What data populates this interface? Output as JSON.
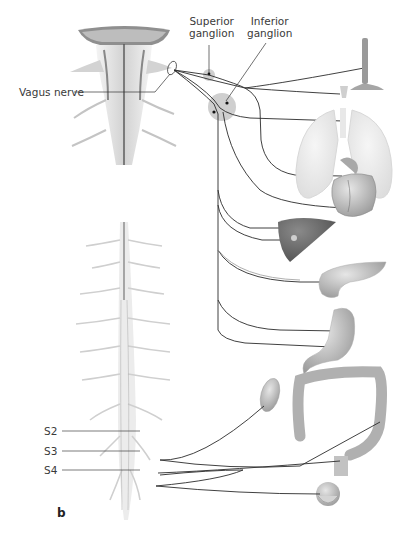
{
  "figure": {
    "panel_letter": "b",
    "colors": {
      "nerve_line": "#2b2b2b",
      "light_nerve_line": "#9a9a9a",
      "ganglion_halo": "#cfcfcf",
      "ganglion_dot": "#111111",
      "tissue_gray": "#b9b9b9",
      "organ_dark": "#6d6d6d",
      "label_text": "#3a3a3a"
    },
    "labels": {
      "superior_ganglion": [
        "Superior",
        "ganglion"
      ],
      "inferior_ganglion": [
        "Inferior",
        "ganglion"
      ],
      "vagus_nerve": "Vagus nerve",
      "sacral": [
        "S2",
        "S3",
        "S4"
      ]
    },
    "structures": {
      "brainstem": "brainstem",
      "spinal_cord": "spinal cord",
      "organs": [
        "pharynx/esophagus",
        "larynx",
        "trachea and lungs",
        "heart",
        "liver",
        "pancreas",
        "stomach",
        "kidney",
        "colon",
        "rectum",
        "bladder"
      ]
    }
  }
}
